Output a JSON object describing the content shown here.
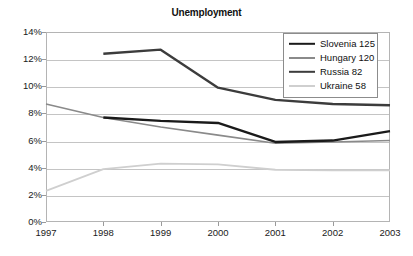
{
  "chart_data": {
    "type": "line",
    "title": "Unemployment",
    "xlabel": "",
    "ylabel": "",
    "categories": [
      "1997",
      "1998",
      "1999",
      "2000",
      "2001",
      "2002",
      "2003"
    ],
    "x": [
      1997,
      1998,
      1999,
      2000,
      2001,
      2002,
      2003
    ],
    "xlim": [
      1997,
      2003
    ],
    "ylim": [
      0,
      14
    ],
    "ytick_labels": [
      "0%",
      "2%",
      "4%",
      "6%",
      "8%",
      "10%",
      "12%",
      "14%"
    ],
    "ytick_values": [
      0,
      2,
      4,
      6,
      8,
      10,
      12,
      14
    ],
    "grid": true,
    "legend_position": "top-right",
    "units": "percent",
    "series": [
      {
        "name": "Slovenia 125",
        "label": "Slovenia 125",
        "color": "#1a1a1a",
        "width": 2.4,
        "x": [
          1998,
          1999,
          2000,
          2001,
          2002,
          2003
        ],
        "values": [
          7.7,
          7.45,
          7.3,
          5.9,
          6.0,
          6.7
        ]
      },
      {
        "name": "Hungary 120",
        "label": "Hungary 120",
        "color": "#8a8a8a",
        "width": 1.6,
        "x": [
          1997,
          1998,
          1999,
          2000,
          2001,
          2002,
          2003
        ],
        "values": [
          8.7,
          7.7,
          7.0,
          6.4,
          5.8,
          5.9,
          6.0
        ]
      },
      {
        "name": "Russia 82",
        "label": "Russia 82",
        "color": "#3c3c3c",
        "width": 2.4,
        "x": [
          1998,
          1999,
          2000,
          2001,
          2002,
          2003
        ],
        "values": [
          12.4,
          12.7,
          9.9,
          9.0,
          8.7,
          8.6
        ]
      },
      {
        "name": "Ukraine 58",
        "label": "Ukraine 58",
        "color": "#cfcfcf",
        "width": 1.8,
        "x": [
          1997,
          1998,
          1999,
          2000,
          2001,
          2002,
          2003
        ],
        "values": [
          2.3,
          3.9,
          4.3,
          4.25,
          3.85,
          3.8,
          3.8
        ]
      }
    ]
  }
}
